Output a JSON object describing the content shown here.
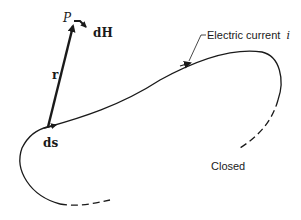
{
  "diagram": {
    "point_label": "P",
    "field_label": "dH",
    "vector_label": "r",
    "element_label": "ds",
    "current_label": "Electric current",
    "current_symbol": "i",
    "closed_label": "Closed",
    "colors": {
      "line": "#1a1a1a",
      "text": "#1a1a1a",
      "background": "#ffffff"
    }
  }
}
